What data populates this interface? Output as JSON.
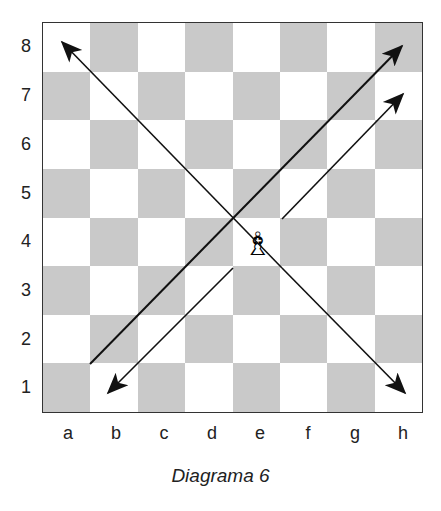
{
  "diagram": {
    "caption": "Diagrama 6",
    "ranks": [
      "8",
      "7",
      "6",
      "5",
      "4",
      "3",
      "2",
      "1"
    ],
    "files": [
      "a",
      "b",
      "c",
      "d",
      "e",
      "f",
      "g",
      "h"
    ],
    "colors": {
      "light": "#ffffff",
      "dark": "#c9c9c9",
      "border": "#333333",
      "arrow": "#111111"
    },
    "piece": {
      "type": "white-bishop",
      "square": "e4",
      "glyph": "♗"
    },
    "arrows": [
      {
        "from": "a1",
        "to": "h8",
        "description": "long diagonal a1-h8"
      },
      {
        "from": "e4",
        "to": "a8",
        "description": "NW diagonal"
      },
      {
        "from": "e4",
        "to": "h7",
        "description": "NE diagonal"
      },
      {
        "from": "e4",
        "to": "b1",
        "description": "SW diagonal"
      },
      {
        "from": "e4",
        "to": "h1",
        "description": "SE diagonal"
      }
    ]
  }
}
